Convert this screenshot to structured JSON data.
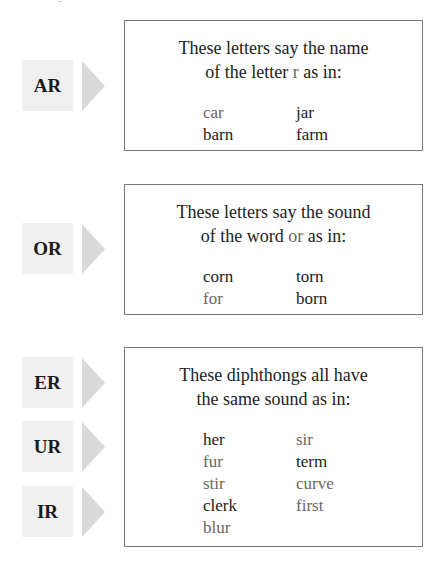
{
  "sections": [
    {
      "labels": [
        "AR"
      ],
      "heading_line1": "These letters say the name",
      "heading_line2_pre": "of the letter ",
      "heading_line2_key": "r",
      "heading_line2_post": " as in:",
      "words_col1": [
        "car",
        "barn"
      ],
      "words_col2": [
        "jar",
        "farm"
      ]
    },
    {
      "labels": [
        "OR"
      ],
      "heading_line1": "These letters say the sound",
      "heading_line2_pre": "of the word ",
      "heading_line2_key": "or",
      "heading_line2_post": " as in:",
      "words_col1": [
        "corn",
        "for"
      ],
      "words_col2": [
        "torn",
        "born"
      ]
    },
    {
      "labels": [
        "ER",
        "UR",
        "IR"
      ],
      "heading_line1": "These diphthongs all have",
      "heading_line2": "the same sound as in:",
      "words_col1": [
        "her",
        "fur",
        "stir",
        "clerk",
        "blur"
      ],
      "words_col2": [
        "sir",
        "term",
        "curve",
        "first"
      ]
    }
  ],
  "colors": {
    "label_bg": "#f0f0f0",
    "arrow": "#d9d9d9",
    "border": "#777777",
    "highlight_text": "#6e6660"
  }
}
